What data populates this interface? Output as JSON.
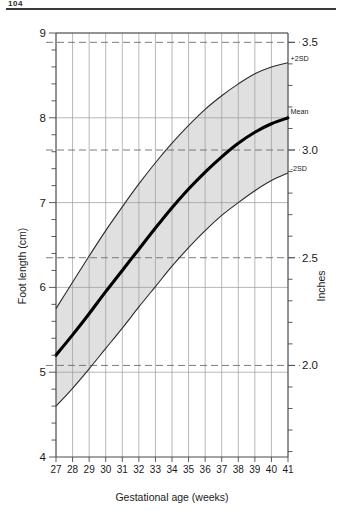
{
  "page": {
    "header_crumb": "104"
  },
  "chart_data": {
    "type": "line",
    "title": "",
    "subtitle": "",
    "xlabel": "Gestational age (weeks)",
    "ylabel": "Foot length (cm)",
    "ylabel_right": "Inches",
    "grid": true,
    "legend": "inline-right-end-labels",
    "xlim": [
      27,
      41
    ],
    "ylim": [
      4,
      9
    ],
    "ylim_right": [
      1.575,
      3.543
    ],
    "x_tick_labels": [
      "27",
      "28",
      "29",
      "30",
      "31",
      "32",
      "33",
      "34",
      "35",
      "36",
      "37",
      "38",
      "39",
      "40",
      "41"
    ],
    "y_tick_labels": [
      "9",
      "8",
      "7",
      "6",
      "5",
      "4"
    ],
    "y_tick_values": [
      9,
      8,
      7,
      6,
      5,
      4
    ],
    "y_minor_step_cm": 0.2,
    "y_right_tick_labels": [
      "3.5",
      "3.0",
      "2.5",
      "2.0"
    ],
    "y_right_tick_values_inches": [
      3.5,
      3.0,
      2.5,
      2.0
    ],
    "y_right_tick_values_cm": [
      8.89,
      7.62,
      6.35,
      5.08
    ],
    "y_right_minor_step_inches": 0.1,
    "reference_lines_dashed_cm": [
      8.89,
      7.62,
      6.35,
      5.08
    ],
    "solid_gridlines_cm": [
      9,
      8,
      7,
      6,
      5
    ],
    "x": [
      27,
      28,
      29,
      30,
      31,
      32,
      33,
      34,
      35,
      36,
      37,
      38,
      39,
      40,
      41
    ],
    "series": [
      {
        "name": "+2SD",
        "label": "+2SD",
        "values": [
          5.75,
          6.06,
          6.37,
          6.67,
          6.95,
          7.22,
          7.47,
          7.7,
          7.91,
          8.1,
          8.26,
          8.4,
          8.52,
          8.6,
          8.65
        ]
      },
      {
        "name": "Mean",
        "label": "Mean",
        "values": [
          5.2,
          5.44,
          5.69,
          5.95,
          6.2,
          6.45,
          6.7,
          6.94,
          7.16,
          7.36,
          7.54,
          7.7,
          7.83,
          7.93,
          8.0
        ]
      },
      {
        "name": "-2SD",
        "label": "-2SD",
        "values": [
          4.6,
          4.81,
          5.04,
          5.28,
          5.52,
          5.77,
          6.01,
          6.25,
          6.47,
          6.67,
          6.85,
          7.0,
          7.14,
          7.26,
          7.35
        ]
      }
    ],
    "shaded_band": {
      "upper_series": "+2SD",
      "lower_series": "Mean",
      "color": "#d4d4d4",
      "note": "normal range shading between mean and +2SD and mean and -2SD"
    },
    "colors": {
      "mean_curve": "#000000",
      "sd_curve": "#2a2a2a",
      "band_fill": "#d4d4d4",
      "grid": "#9a9a9a",
      "dashed_reference": "#6b6b6b",
      "axis": "#4a4a4a"
    }
  }
}
